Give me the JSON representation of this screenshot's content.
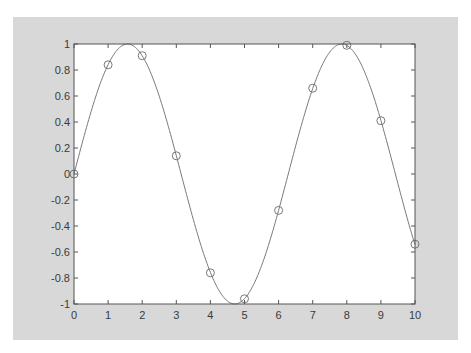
{
  "figure": {
    "background": "#d8d8d8",
    "axes_background": "#ffffff",
    "line_color": "#7a7a7a",
    "marker_color": "#6a6a6a"
  },
  "chart_data": {
    "type": "line",
    "title": "",
    "xlabel": "",
    "ylabel": "",
    "xlim": [
      0,
      10
    ],
    "ylim": [
      -1,
      1
    ],
    "grid": false,
    "legend": null,
    "x_ticks": [
      0,
      1,
      2,
      3,
      4,
      5,
      6,
      7,
      8,
      9,
      10
    ],
    "x_tick_labels": [
      "0",
      "1",
      "2",
      "3",
      "4",
      "5",
      "6",
      "7",
      "8",
      "9",
      "10"
    ],
    "y_ticks": [
      -1,
      -0.8,
      -0.6,
      -0.4,
      -0.2,
      0,
      0.2,
      0.4,
      0.6,
      0.8,
      1
    ],
    "y_tick_labels": [
      "-1",
      "-0.8",
      "-0.6",
      "-0.4",
      "-0.2",
      "0",
      "0.2",
      "0.4",
      "0.6",
      "0.8",
      "1"
    ],
    "series": [
      {
        "name": "sin(x) curve",
        "style": "solid line",
        "function": "sin(x)",
        "x_range": [
          0,
          10
        ]
      },
      {
        "name": "samples",
        "style": "circle markers",
        "x": [
          0,
          1,
          2,
          3,
          4,
          5,
          6,
          7,
          8,
          9,
          10
        ],
        "y": [
          0,
          0.84,
          0.91,
          0.14,
          -0.76,
          -0.96,
          -0.28,
          0.66,
          0.99,
          0.41,
          -0.54
        ]
      }
    ]
  }
}
